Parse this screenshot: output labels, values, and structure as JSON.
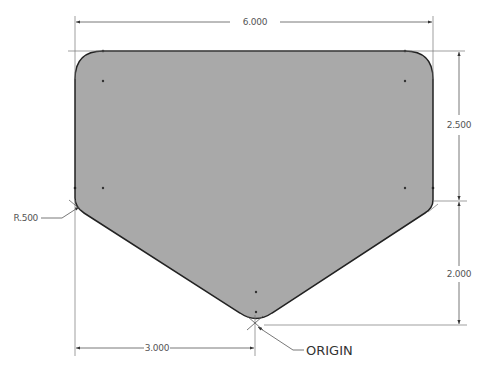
{
  "drawing": {
    "colors": {
      "fill": "#a9a9a9",
      "outline": "#222222",
      "dimension_line": "#555555",
      "text": "#555555",
      "background": "#ffffff"
    },
    "dimensions": {
      "width_overall": "6.000",
      "height_upper": "2.500",
      "height_lower": "2.000",
      "half_width": "3.000",
      "radius": "R.500"
    },
    "labels": {
      "origin": "ORIGIN"
    }
  }
}
